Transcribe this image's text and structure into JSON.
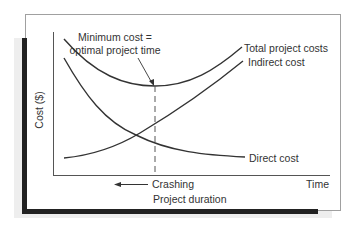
{
  "figure": {
    "annotation_line1": "Minimum cost =",
    "annotation_line2": "optimal project time",
    "y_axis_label": "Cost ($)",
    "x_axis_end_label": "Time",
    "crashing_label": "Crashing",
    "x_axis_label": "Project duration",
    "curves": {
      "total": "Total project costs",
      "indirect": "Indirect cost",
      "direct": "Direct cost"
    }
  },
  "colors": {
    "line": "#333333",
    "frame": "#9a9a9a",
    "shadow_dark": "#222222",
    "shadow_light": "#ececec"
  }
}
